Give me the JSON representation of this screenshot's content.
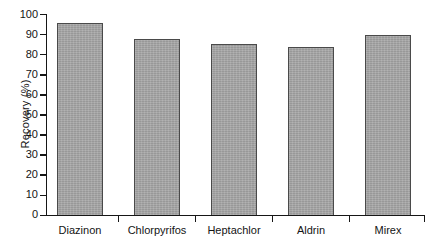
{
  "chart_data": {
    "type": "bar",
    "title": "",
    "subtitle": "",
    "xlabel": "",
    "ylabel": "Recovery (%)",
    "categories": [
      "Diazinon",
      "Chlorpyrifos",
      "Heptachlor",
      "Aldrin",
      "Mirex"
    ],
    "values": [
      96,
      88,
      85.5,
      84,
      90
    ],
    "ylim": [
      0,
      100
    ],
    "yticks": [
      0,
      10,
      20,
      30,
      40,
      50,
      60,
      70,
      80,
      90,
      100
    ],
    "ytick_labels": [
      "0",
      "10",
      "20",
      "30",
      "40",
      "50",
      "60",
      "70",
      "80",
      "90",
      "100"
    ],
    "grid": false,
    "legend": null,
    "annotations": [],
    "bar_color": "#a3a3a3",
    "bar_edge_color": "#4a4a4a",
    "axis_color": "#161616",
    "background": "#ffffff"
  }
}
